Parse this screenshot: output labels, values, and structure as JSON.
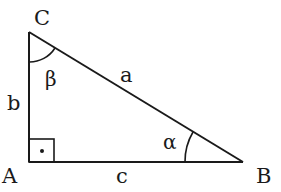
{
  "diagram": {
    "type": "right-triangle",
    "vertices": [
      {
        "id": "A",
        "label": "A",
        "x": 29,
        "y": 162
      },
      {
        "id": "B",
        "label": "B",
        "x": 243,
        "y": 162
      },
      {
        "id": "C",
        "label": "C",
        "x": 29,
        "y": 32
      }
    ],
    "sides": [
      {
        "id": "a",
        "label": "a",
        "from": "C",
        "to": "B"
      },
      {
        "id": "b",
        "label": "b",
        "from": "A",
        "to": "C"
      },
      {
        "id": "c",
        "label": "c",
        "from": "A",
        "to": "B"
      }
    ],
    "angles": [
      {
        "id": "alpha",
        "label": "α",
        "at": "B"
      },
      {
        "id": "beta",
        "label": "β",
        "at": "C"
      },
      {
        "id": "right",
        "label": "·",
        "at": "A",
        "marker": "right-angle-square-with-dot"
      }
    ],
    "colors": {
      "stroke": "#1a1a1a",
      "background": "#ffffff"
    }
  }
}
